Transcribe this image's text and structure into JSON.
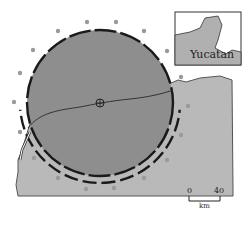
{
  "map": {
    "title": "Chicxulub crater, Yucatan Peninsula",
    "inset": {
      "label": "Yucatan"
    },
    "scale_bar": {
      "min_label": "0",
      "max_label": "40",
      "unit": "km"
    },
    "colors": {
      "land": "#b9b9b9",
      "crater": "#8e8e8e",
      "ring": "#1a1a1a",
      "dots": "#9a9a9a",
      "ocean": "#ffffff"
    }
  }
}
